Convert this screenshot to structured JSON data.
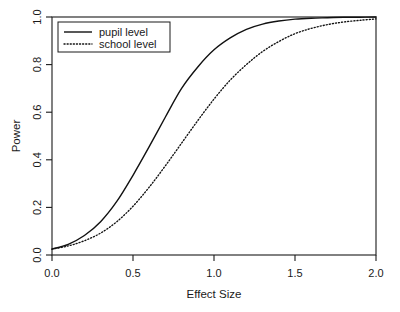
{
  "chart_data": {
    "type": "line",
    "title": "",
    "xlabel": "Effect Size",
    "ylabel": "Power",
    "xlim": [
      0.0,
      2.0
    ],
    "ylim": [
      0.0,
      1.0
    ],
    "grid": false,
    "legend_position": "top-left",
    "xticks": [
      "0.0",
      "0.5",
      "1.0",
      "1.5",
      "2.0"
    ],
    "xtick_values": [
      0.0,
      0.5,
      1.0,
      1.5,
      2.0
    ],
    "yticks": [
      "0.0",
      "0.2",
      "0.4",
      "0.6",
      "0.8",
      "1.0"
    ],
    "ytick_values": [
      0.0,
      0.2,
      0.4,
      0.6,
      0.8,
      1.0
    ],
    "x": [
      0.0,
      0.1,
      0.2,
      0.3,
      0.4,
      0.5,
      0.6,
      0.7,
      0.8,
      0.9,
      1.0,
      1.1,
      1.2,
      1.3,
      1.4,
      1.5,
      1.6,
      1.7,
      1.8,
      1.9,
      2.0
    ],
    "series": [
      {
        "name": "pupil level",
        "style": "solid",
        "color": "#111111",
        "values": [
          0.025,
          0.045,
          0.082,
          0.14,
          0.225,
          0.335,
          0.455,
          0.58,
          0.7,
          0.79,
          0.862,
          0.912,
          0.948,
          0.97,
          0.983,
          0.991,
          0.995,
          0.997,
          0.999,
          0.999,
          1.0
        ]
      },
      {
        "name": "school level",
        "style": "dotted",
        "color": "#111111",
        "values": [
          0.025,
          0.038,
          0.06,
          0.092,
          0.14,
          0.205,
          0.285,
          0.375,
          0.47,
          0.565,
          0.655,
          0.735,
          0.8,
          0.855,
          0.897,
          0.93,
          0.952,
          0.968,
          0.979,
          0.986,
          0.992
        ]
      }
    ]
  },
  "legend": {
    "entries": [
      {
        "label": "pupil level",
        "style": "solid"
      },
      {
        "label": "school level",
        "style": "dotted"
      }
    ]
  }
}
